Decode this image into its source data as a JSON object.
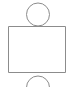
{
  "canvas": {
    "width": 73,
    "height": 87,
    "background_color": "#ffffff",
    "stroke_color": "#8c8c8c",
    "stroke_width": 1,
    "fill": "none"
  },
  "diagram": {
    "type": "line-art-shape-figure",
    "title": "",
    "shapes": [
      {
        "name": "top-circle",
        "kind": "circle",
        "cx": 38,
        "cy": 14.5,
        "r": 11.5,
        "clipped": false,
        "stroke_color": "#8c8c8c",
        "stroke_width": 1,
        "fill": "none"
      },
      {
        "name": "body-rectangle",
        "kind": "rect",
        "x": 8.5,
        "y": 26.5,
        "width": 57,
        "height": 46,
        "stroke_color": "#8c8c8c",
        "stroke_width": 1,
        "fill": "none"
      },
      {
        "name": "bottom-circle",
        "kind": "circle",
        "cx": 38,
        "cy": 87.5,
        "r": 11.5,
        "clipped": true,
        "clip_edge": "bottom",
        "stroke_color": "#8c8c8c",
        "stroke_width": 1,
        "fill": "none"
      }
    ]
  }
}
